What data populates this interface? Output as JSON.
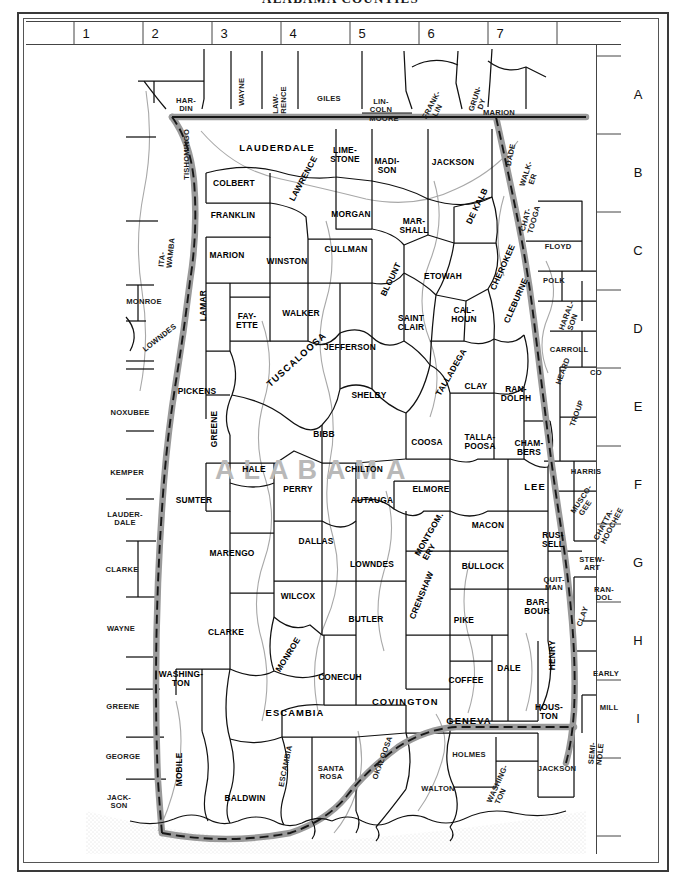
{
  "title": "ALABAMA COUNTIES",
  "watermark": "ALABAMA",
  "index": {
    "columns": [
      "1",
      "2",
      "3",
      "4",
      "5",
      "6",
      "7"
    ],
    "rows": [
      "A",
      "B",
      "C",
      "D",
      "E",
      "F",
      "G",
      "H",
      "I"
    ]
  },
  "colors": {
    "state_boundary": "#8c8c8c",
    "county_line": "#1a1a1a",
    "river": "#9c9c9c",
    "water": "#ededed",
    "frame": "#3a3a3a",
    "watermark": "#b9b9b9"
  },
  "alabama_counties": [
    {
      "name": "LAUDERDALE",
      "x": 251,
      "y": 128,
      "w": 96
    },
    {
      "name": "LIME-\nSTONE",
      "x": 319,
      "y": 131,
      "w": 44
    },
    {
      "name": "MADI-\nSON",
      "x": 361,
      "y": 142,
      "w": 42
    },
    {
      "name": "JACKSON",
      "x": 427,
      "y": 143,
      "w": 54
    },
    {
      "name": "COLBERT",
      "x": 208,
      "y": 164,
      "w": 58
    },
    {
      "name": "LAWRENCE",
      "x": 269,
      "y": 175,
      "w": 14,
      "rot": 62
    },
    {
      "name": "MORGAN",
      "x": 325,
      "y": 195,
      "w": 50
    },
    {
      "name": "FRANKLIN",
      "x": 207,
      "y": 196,
      "w": 54
    },
    {
      "name": "MAR-\nSHALL",
      "x": 388,
      "y": 202,
      "w": 42
    },
    {
      "name": "DE KALB",
      "x": 446,
      "y": 197,
      "w": 16,
      "rot": 64
    },
    {
      "name": "CULLMAN",
      "x": 320,
      "y": 230,
      "w": 52
    },
    {
      "name": "MARION",
      "x": 201,
      "y": 236,
      "w": 48
    },
    {
      "name": "WINSTON",
      "x": 261,
      "y": 242,
      "w": 50
    },
    {
      "name": "ETOWAH",
      "x": 417,
      "y": 257,
      "w": 48
    },
    {
      "name": "CHEROKEE",
      "x": 470,
      "y": 263,
      "w": 16,
      "rot": 66
    },
    {
      "name": "BLOUNT",
      "x": 360,
      "y": 270,
      "w": 14,
      "rot": 64
    },
    {
      "name": "LAMAR",
      "x": 177,
      "y": 295,
      "w": 14,
      "rot": 90
    },
    {
      "name": "FAY-\nETTE",
      "x": 221,
      "y": 297,
      "w": 34
    },
    {
      "name": "WALKER",
      "x": 275,
      "y": 294,
      "w": 48
    },
    {
      "name": "SAINT\nCLAIR",
      "x": 385,
      "y": 299,
      "w": 38
    },
    {
      "name": "CAL-\nHOUN",
      "x": 438,
      "y": 291,
      "w": 36
    },
    {
      "name": "CLEBURNE",
      "x": 483,
      "y": 297,
      "w": 14,
      "rot": 66
    },
    {
      "name": "JEFFERSON",
      "x": 324,
      "y": 328,
      "w": 64
    },
    {
      "name": "PICKENS",
      "x": 171,
      "y": 372,
      "w": 48
    },
    {
      "name": "TUSCALOOSA",
      "x": 248,
      "y": 360,
      "w": 16,
      "rot": 42
    },
    {
      "name": "SHELBY",
      "x": 343,
      "y": 376,
      "w": 48
    },
    {
      "name": "TALLADEGA",
      "x": 416,
      "y": 369,
      "w": 16,
      "rot": 60
    },
    {
      "name": "CLAY",
      "x": 450,
      "y": 367,
      "w": 32
    },
    {
      "name": "RAN-\nDOLPH",
      "x": 490,
      "y": 370,
      "w": 38
    },
    {
      "name": "GREENE",
      "x": 188,
      "y": 421,
      "w": 14,
      "rot": 90
    },
    {
      "name": "BIBB",
      "x": 298,
      "y": 415,
      "w": 32
    },
    {
      "name": "COOSA",
      "x": 401,
      "y": 423,
      "w": 38
    },
    {
      "name": "TALLA-\nPOOSA",
      "x": 454,
      "y": 418,
      "w": 42
    },
    {
      "name": "CHAM-\nBERS",
      "x": 503,
      "y": 424,
      "w": 38
    },
    {
      "name": "HALE",
      "x": 228,
      "y": 450,
      "w": 34
    },
    {
      "name": "CHILTON",
      "x": 338,
      "y": 450,
      "w": 50
    },
    {
      "name": "SUMTER",
      "x": 168,
      "y": 481,
      "w": 52
    },
    {
      "name": "PERRY",
      "x": 272,
      "y": 470,
      "w": 40
    },
    {
      "name": "AUTAUGA",
      "x": 346,
      "y": 481,
      "w": 50
    },
    {
      "name": "ELMORE",
      "x": 405,
      "y": 470,
      "w": 44
    },
    {
      "name": "LEE",
      "x": 509,
      "y": 467,
      "w": 34
    },
    {
      "name": "MARENGO",
      "x": 206,
      "y": 534,
      "w": 52
    },
    {
      "name": "DALLAS",
      "x": 290,
      "y": 522,
      "w": 46
    },
    {
      "name": "MONTGOM.\nERY",
      "x": 399,
      "y": 526,
      "w": 18,
      "rot": 60
    },
    {
      "name": "MACON",
      "x": 462,
      "y": 506,
      "w": 42
    },
    {
      "name": "RUS-\nSELL",
      "x": 527,
      "y": 516,
      "w": 34
    },
    {
      "name": "LOWNDES",
      "x": 346,
      "y": 545,
      "w": 50
    },
    {
      "name": "BULLOCK",
      "x": 457,
      "y": 547,
      "w": 46
    },
    {
      "name": "CLARKE",
      "x": 200,
      "y": 613,
      "w": 44
    },
    {
      "name": "WILCOX",
      "x": 272,
      "y": 577,
      "w": 46
    },
    {
      "name": "BUTLER",
      "x": 340,
      "y": 600,
      "w": 42
    },
    {
      "name": "CRENSHAW",
      "x": 389,
      "y": 592,
      "w": 16,
      "rot": 68
    },
    {
      "name": "PIKE",
      "x": 438,
      "y": 601,
      "w": 34
    },
    {
      "name": "BAR-\nBOUR",
      "x": 511,
      "y": 583,
      "w": 36
    },
    {
      "name": "MONROE",
      "x": 256,
      "y": 645,
      "w": 16,
      "rot": 58
    },
    {
      "name": "CONECUH",
      "x": 314,
      "y": 658,
      "w": 52
    },
    {
      "name": "COFFEE",
      "x": 440,
      "y": 661,
      "w": 42
    },
    {
      "name": "DALE",
      "x": 483,
      "y": 649,
      "w": 32
    },
    {
      "name": "HENRY",
      "x": 526,
      "y": 644,
      "w": 14,
      "rot": 90
    },
    {
      "name": "WASHING-\nTON",
      "x": 155,
      "y": 655,
      "w": 50
    },
    {
      "name": "ESCAMBIA",
      "x": 269,
      "y": 693,
      "w": 66
    },
    {
      "name": "COVINGTON",
      "x": 375,
      "y": 682,
      "w": 58
    },
    {
      "name": "GENEVA",
      "x": 443,
      "y": 701,
      "w": 56
    },
    {
      "name": "HOUS-\nTON",
      "x": 523,
      "y": 688,
      "w": 36
    },
    {
      "name": "MOBILE",
      "x": 153,
      "y": 760,
      "w": 14,
      "rot": 90
    },
    {
      "name": "BALDWIN",
      "x": 219,
      "y": 779,
      "w": 52
    }
  ],
  "neighbor_counties": [
    {
      "name": "HAR-\nDIN",
      "x": 160,
      "y": 82,
      "w": 34,
      "state": "TN"
    },
    {
      "name": "WAYNE",
      "x": 216,
      "y": 80,
      "w": 14,
      "state": "TN",
      "rot": 90
    },
    {
      "name": "LAW-\nRENCE",
      "x": 254,
      "y": 83,
      "w": 16,
      "state": "TN",
      "rot": 90
    },
    {
      "name": "GILES",
      "x": 303,
      "y": 80,
      "w": 38,
      "state": "TN"
    },
    {
      "name": "LIN-\nCOLN",
      "x": 355,
      "y": 83,
      "w": 30,
      "state": "TN"
    },
    {
      "name": "MOORE",
      "x": 358,
      "y": 100,
      "w": 34,
      "state": "TN"
    },
    {
      "name": "FRANK-\nLIN",
      "x": 408,
      "y": 86,
      "w": 26,
      "state": "TN",
      "rot": 62
    },
    {
      "name": "GRUN-\nDY",
      "x": 452,
      "y": 80,
      "w": 20,
      "state": "TN",
      "rot": 72
    },
    {
      "name": "MARION",
      "x": 473,
      "y": 94,
      "w": 44,
      "state": "TN"
    },
    {
      "name": "TISHOMINGO",
      "x": 161,
      "y": 153,
      "w": 16,
      "state": "MS",
      "rot": 90
    },
    {
      "name": "DADE",
      "x": 484,
      "y": 140,
      "w": 14,
      "state": "GA",
      "rot": 78
    },
    {
      "name": "WALK-\nER",
      "x": 503,
      "y": 155,
      "w": 20,
      "state": "GA",
      "rot": 72
    },
    {
      "name": "CHAT-\nTOOGA",
      "x": 503,
      "y": 200,
      "w": 20,
      "state": "GA",
      "rot": 74
    },
    {
      "name": "FLOYD",
      "x": 532,
      "y": 228,
      "w": 38,
      "state": "GA"
    },
    {
      "name": "ITA-\nWAMBA",
      "x": 140,
      "y": 237,
      "w": 16,
      "state": "MS",
      "rot": 84
    },
    {
      "name": "POLK",
      "x": 528,
      "y": 262,
      "w": 32,
      "state": "GA"
    },
    {
      "name": "MONROE",
      "x": 118,
      "y": 283,
      "w": 42,
      "state": "MS"
    },
    {
      "name": "HARAL-\nSON",
      "x": 543,
      "y": 298,
      "w": 22,
      "state": "GA",
      "rot": 70
    },
    {
      "name": "LOWNDES",
      "x": 125,
      "y": 326,
      "w": 18,
      "state": "MS",
      "rot": 38
    },
    {
      "name": "CARROLL",
      "x": 543,
      "y": 331,
      "w": 48,
      "state": "GA"
    },
    {
      "name": "HEARD",
      "x": 535,
      "y": 358,
      "w": 16,
      "state": "GA",
      "rot": 70
    },
    {
      "name": "CO",
      "x": 570,
      "y": 354,
      "w": 16,
      "state": "GA"
    },
    {
      "name": "NOXUBEE",
      "x": 104,
      "y": 394,
      "w": 50,
      "state": "MS"
    },
    {
      "name": "TROUP",
      "x": 549,
      "y": 400,
      "w": 16,
      "state": "GA",
      "rot": 70
    },
    {
      "name": "KEMPER",
      "x": 101,
      "y": 454,
      "w": 46,
      "state": "MS"
    },
    {
      "name": "HARRIS",
      "x": 560,
      "y": 453,
      "w": 42,
      "state": "GA"
    },
    {
      "name": "LAUDER-\nDALE",
      "x": 99,
      "y": 496,
      "w": 44,
      "state": "MS"
    },
    {
      "name": "MUSCO-\nGEE",
      "x": 556,
      "y": 483,
      "w": 22,
      "state": "GA",
      "rot": 56
    },
    {
      "name": "CHATTA-\nHOOCHEE",
      "x": 578,
      "y": 510,
      "w": 20,
      "state": "GA",
      "rot": 62
    },
    {
      "name": "CLARKE",
      "x": 96,
      "y": 551,
      "w": 42,
      "state": "MS"
    },
    {
      "name": "STEW-\nART",
      "x": 566,
      "y": 541,
      "w": 32,
      "state": "GA"
    },
    {
      "name": "QUIT-\nMAN",
      "x": 528,
      "y": 561,
      "w": 26,
      "state": "GA"
    },
    {
      "name": "WAYNE",
      "x": 95,
      "y": 610,
      "w": 42,
      "state": "MS"
    },
    {
      "name": "RAN-\nDOL",
      "x": 578,
      "y": 571,
      "w": 28,
      "state": "GA"
    },
    {
      "name": "CLAY",
      "x": 556,
      "y": 600,
      "w": 16,
      "state": "GA",
      "rot": 70
    },
    {
      "name": "EARLY",
      "x": 580,
      "y": 655,
      "w": 34,
      "state": "GA"
    },
    {
      "name": "GREENE",
      "x": 97,
      "y": 688,
      "w": 42,
      "state": "MS"
    },
    {
      "name": "MILL",
      "x": 583,
      "y": 689,
      "w": 28,
      "state": "GA"
    },
    {
      "name": "SEMI-\nNOLE",
      "x": 570,
      "y": 733,
      "w": 18,
      "state": "GA",
      "rot": 84
    },
    {
      "name": "GEORGE",
      "x": 97,
      "y": 738,
      "w": 42,
      "state": "MS"
    },
    {
      "name": "JACK-\nSON",
      "x": 93,
      "y": 779,
      "w": 34,
      "state": "MS"
    },
    {
      "name": "SANTA\nROSA",
      "x": 305,
      "y": 750,
      "w": 42,
      "state": "FL"
    },
    {
      "name": "OKALOOSA",
      "x": 352,
      "y": 752,
      "w": 18,
      "state": "FL",
      "rot": 70
    },
    {
      "name": "HOLMES",
      "x": 443,
      "y": 736,
      "w": 42,
      "state": "FL"
    },
    {
      "name": "WALTON",
      "x": 412,
      "y": 770,
      "w": 44,
      "state": "FL"
    },
    {
      "name": "WASHING-\nTON",
      "x": 471,
      "y": 772,
      "w": 20,
      "state": "FL",
      "rot": 66
    },
    {
      "name": "JACKSON",
      "x": 531,
      "y": 750,
      "w": 48,
      "state": "FL"
    },
    {
      "name": "ESCAMBIA",
      "x": 257,
      "y": 760,
      "w": 16,
      "state": "FL",
      "rot": 78
    }
  ]
}
